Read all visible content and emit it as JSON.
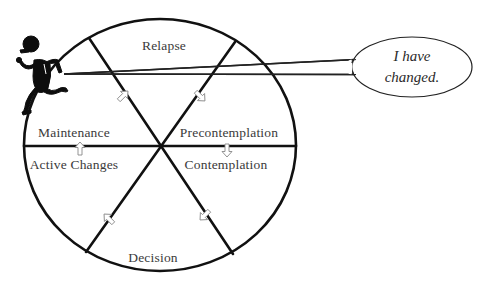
{
  "diagram": {
    "stages": [
      {
        "id": "relapse",
        "label": "Relapse"
      },
      {
        "id": "precontemplation",
        "label": "Precontemplation"
      },
      {
        "id": "contemplation",
        "label": "Contemplation"
      },
      {
        "id": "decision",
        "label": "Decision"
      },
      {
        "id": "active-changes",
        "label": "Active Changes"
      },
      {
        "id": "maintenance",
        "label": "Maintenance"
      }
    ],
    "flow_direction": "clockwise",
    "speech_bubble": {
      "line1": "I have",
      "line2": "changed."
    },
    "figure": "running-person-icon",
    "colors": {
      "line": "#111111",
      "text": "#3a3a3a",
      "arrow_outline": "#888888",
      "background": "#ffffff"
    }
  }
}
